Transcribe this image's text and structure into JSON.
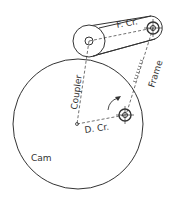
{
  "diagram": {
    "labels": {
      "follower_crank": "F. Cr.",
      "coupler": "Coupler",
      "frame": "Frame",
      "driving_crank": "D. Cr.",
      "cam": "Cam"
    },
    "colors": {
      "line": "#333333",
      "background": "#ffffff"
    }
  }
}
